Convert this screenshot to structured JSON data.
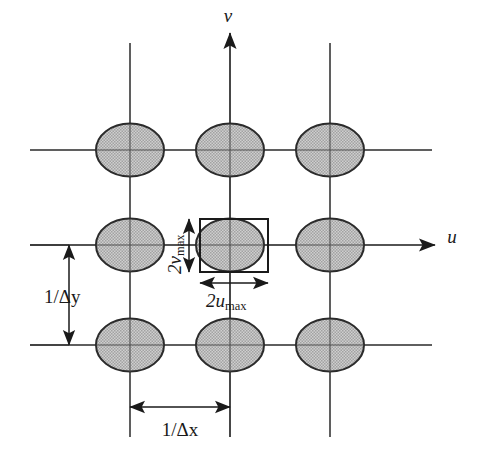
{
  "figure": {
    "background_color": "#ffffff",
    "line_color": "#1a1a1a",
    "ellipse_fill": "#b9b9b9",
    "ellipse_stroke": "#2b2b2b"
  },
  "axes": {
    "horizontal": {
      "name": "u-axis",
      "label": "u",
      "label_x": 452,
      "label_y": 240,
      "start_x": 30,
      "end_x": 438,
      "y": 245
    },
    "vertical": {
      "name": "v-axis",
      "label": "v",
      "label_x": 230,
      "label_y": 20,
      "start_y": 30,
      "end_y": 440,
      "x": 230
    }
  },
  "grid": {
    "vertical_lines_x": [
      130,
      230,
      330
    ],
    "horizontal_lines_y": [
      150,
      245,
      345
    ],
    "vertical_extent": [
      43,
      437
    ],
    "horizontal_extent": [
      30,
      432
    ]
  },
  "spectra": {
    "name": "replicated-spectrum-ellipses",
    "rx": 34,
    "ry": 26.5,
    "centers": [
      {
        "cx": 130,
        "cy": 150
      },
      {
        "cx": 230,
        "cy": 150
      },
      {
        "cx": 330,
        "cy": 150
      },
      {
        "cx": 130,
        "cy": 245
      },
      {
        "cx": 230,
        "cy": 245
      },
      {
        "cx": 330,
        "cy": 245
      },
      {
        "cx": 130,
        "cy": 345
      },
      {
        "cx": 230,
        "cy": 345
      },
      {
        "cx": 330,
        "cy": 345
      }
    ]
  },
  "bounding_box": {
    "name": "baseband-rectangle",
    "x": 200,
    "y": 219,
    "width": 68,
    "height": 53
  },
  "dimensions": [
    {
      "id": "u-max",
      "label_prefix": "2",
      "label_italic": "u",
      "label_sub": "max",
      "orientation": "horizontal",
      "arrow_y": 283,
      "arrow_x1": 200,
      "arrow_x2": 268,
      "text_x": 234,
      "text_y": 305
    },
    {
      "id": "v-max",
      "label_prefix": "2",
      "label_italic": "v",
      "label_sub": "max",
      "orientation": "vertical",
      "arrow_x": 189,
      "arrow_y1": 219,
      "arrow_y2": 272,
      "text_x": 180,
      "text_y": 246
    },
    {
      "id": "delta-y",
      "label_text": "1/",
      "label_italic": "Δy",
      "orientation": "vertical",
      "arrow_x": 69,
      "arrow_y1": 245,
      "arrow_y2": 345,
      "text_x": 40,
      "text_y": 302
    },
    {
      "id": "delta-x",
      "label_text": "1/",
      "label_italic": "Δx",
      "orientation": "horizontal",
      "arrow_y": 407,
      "arrow_x1": 130,
      "arrow_x2": 230,
      "text_x": 180,
      "text_y": 434
    }
  ],
  "labels": {
    "u_axis": "u",
    "v_axis": "v",
    "two_u_max": "2u",
    "two_u_max_sub": "max",
    "two_v_max": "2v",
    "two_v_max_sub": "max",
    "inv_delta_x": "1/Δx",
    "inv_delta_y": "1/Δy"
  }
}
